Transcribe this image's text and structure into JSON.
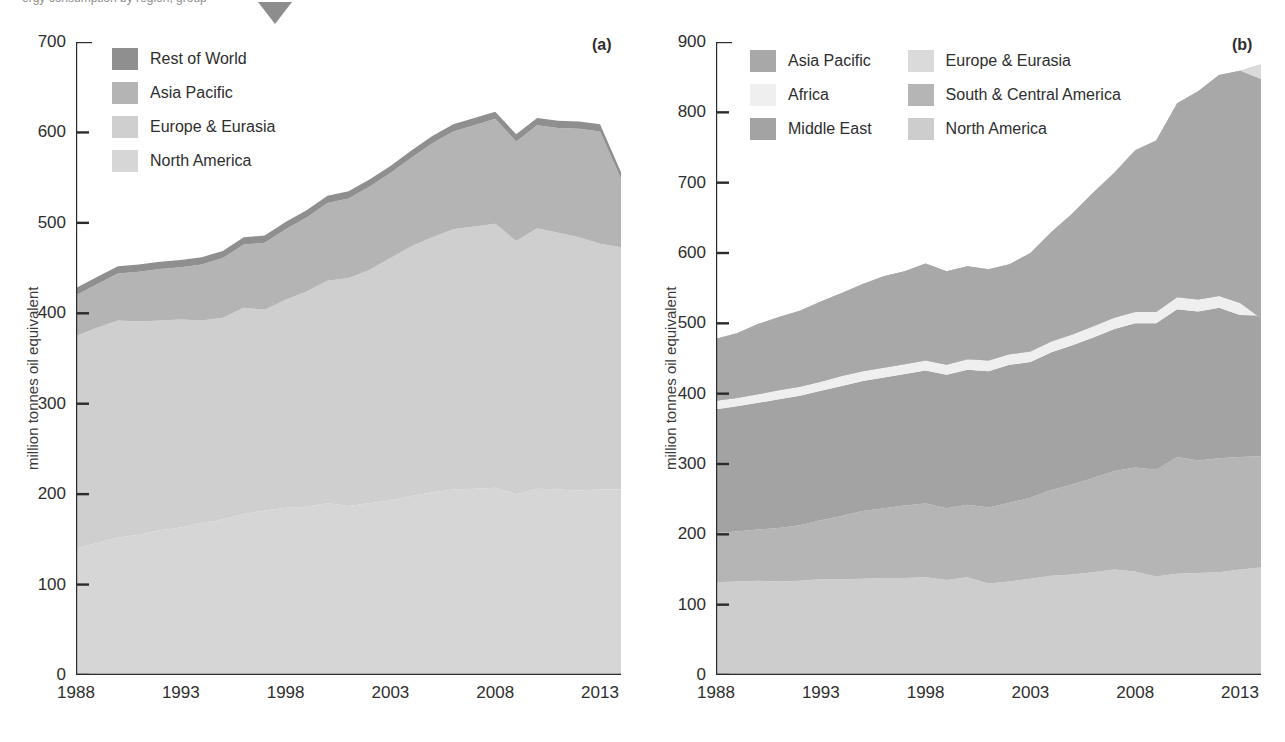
{
  "page": {
    "clipped_header_text": "ergy consumption by region, group",
    "marker_icon": "triangle-down-marker"
  },
  "panel_a": {
    "tag": "(a)",
    "ylabel": "million tonnes oil equivalent",
    "yticks": [
      0,
      100,
      200,
      300,
      400,
      500,
      600,
      700
    ],
    "xticks": [
      "1988",
      "1993",
      "1998",
      "2003",
      "2008",
      "2013"
    ],
    "legend": [
      {
        "label": "Rest of World",
        "color": "#8f8f8f"
      },
      {
        "label": "Asia Pacific",
        "color": "#b4b4b4"
      },
      {
        "label": "Europe & Eurasia",
        "color": "#cfcfcf"
      },
      {
        "label": "North America",
        "color": "#d6d6d6"
      }
    ]
  },
  "panel_b": {
    "tag": "(b)",
    "ylabel": "million tonnes oil equivalent",
    "yticks": [
      0,
      100,
      200,
      300,
      400,
      500,
      600,
      700,
      800,
      900
    ],
    "xticks": [
      "1988",
      "1993",
      "1998",
      "2003",
      "2008",
      "2013"
    ],
    "legend": [
      {
        "label": "Asia Pacific",
        "color": "#a8a8a8"
      },
      {
        "label": "Europe & Eurasia",
        "color": "#dadada"
      },
      {
        "label": "Africa",
        "color": "#efefef"
      },
      {
        "label": "South & Central America",
        "color": "#b5b5b5"
      },
      {
        "label": "Middle East",
        "color": "#a3a3a3"
      },
      {
        "label": "North America",
        "color": "#cdcdcd"
      }
    ]
  },
  "chart_data": [
    {
      "id": "chart-a",
      "type": "area",
      "title": "(a)",
      "xlabel": "",
      "ylabel": "million tonnes oil equivalent",
      "ylim": [
        0,
        700
      ],
      "xlim": [
        1988,
        2014
      ],
      "grid": false,
      "legend_position": "top-left",
      "stacked": true,
      "x": [
        1988,
        1989,
        1990,
        1991,
        1992,
        1993,
        1994,
        1995,
        1996,
        1997,
        1998,
        1999,
        2000,
        2001,
        2002,
        2003,
        2004,
        2005,
        2006,
        2007,
        2008,
        2009,
        2010,
        2011,
        2012,
        2013,
        2014
      ],
      "series": [
        {
          "name": "North America",
          "color": "#d6d6d6",
          "values": [
            140,
            146,
            152,
            155,
            160,
            163,
            168,
            172,
            178,
            182,
            185,
            186,
            190,
            187,
            190,
            193,
            198,
            202,
            205,
            206,
            207,
            200,
            206,
            205,
            204,
            205,
            205
          ]
        },
        {
          "name": "Europe & Eurasia",
          "color": "#cfcfcf",
          "values": [
            235,
            238,
            240,
            236,
            232,
            230,
            224,
            223,
            228,
            222,
            230,
            238,
            246,
            252,
            258,
            268,
            276,
            282,
            288,
            290,
            292,
            280,
            288,
            284,
            280,
            272,
            268
          ]
        },
        {
          "name": "Asia Pacific",
          "color": "#b4b4b4",
          "values": [
            45,
            48,
            52,
            55,
            57,
            58,
            62,
            66,
            70,
            74,
            78,
            82,
            86,
            88,
            92,
            94,
            98,
            104,
            108,
            112,
            116,
            110,
            114,
            116,
            120,
            124,
            76
          ]
        },
        {
          "name": "Rest of World",
          "color": "#8f8f8f",
          "values": [
            8,
            8,
            8,
            8,
            8,
            8,
            8,
            8,
            8,
            8,
            8,
            8,
            8,
            8,
            8,
            8,
            8,
            8,
            8,
            8,
            8,
            8,
            8,
            8,
            8,
            8,
            7
          ]
        }
      ],
      "totals": [
        428,
        440,
        452,
        454,
        457,
        459,
        462,
        469,
        484,
        486,
        501,
        514,
        530,
        535,
        548,
        563,
        580,
        596,
        609,
        616,
        623,
        598,
        616,
        613,
        612,
        609,
        556
      ],
      "annotations": [
        "Totals rise from about 428 in 1988 to a peak near 625 around 2007, then fall to about 556 in 2014"
      ]
    },
    {
      "id": "chart-b",
      "type": "area",
      "title": "(b)",
      "xlabel": "",
      "ylabel": "million tonnes oil equivalent",
      "ylim": [
        0,
        900
      ],
      "xlim": [
        1988,
        2014
      ],
      "grid": false,
      "legend_position": "top-left",
      "stacked": true,
      "x": [
        1988,
        1989,
        1990,
        1991,
        1992,
        1993,
        1994,
        1995,
        1996,
        1997,
        1998,
        1999,
        2000,
        2001,
        2002,
        2003,
        2004,
        2005,
        2006,
        2007,
        2008,
        2009,
        2010,
        2011,
        2012,
        2013,
        2014
      ],
      "series": [
        {
          "name": "North America",
          "color": "#cdcdcd",
          "values": [
            132,
            133,
            134,
            133,
            134,
            136,
            136,
            137,
            138,
            138,
            139,
            135,
            139,
            130,
            133,
            137,
            141,
            143,
            146,
            150,
            147,
            140,
            144,
            145,
            146,
            150,
            153
          ]
        },
        {
          "name": "South & Central America",
          "color": "#b5b5b5",
          "values": [
            70,
            71,
            73,
            76,
            79,
            84,
            90,
            96,
            99,
            103,
            105,
            102,
            103,
            108,
            112,
            115,
            122,
            128,
            134,
            140,
            148,
            152,
            166,
            160,
            162,
            160,
            158
          ]
        },
        {
          "name": "Middle East",
          "color": "#a3a3a3",
          "values": [
            176,
            178,
            180,
            183,
            184,
            184,
            185,
            185,
            186,
            187,
            189,
            190,
            192,
            194,
            196,
            193,
            196,
            198,
            200,
            202,
            205,
            208,
            210,
            212,
            214,
            202,
            200
          ]
        },
        {
          "name": "Africa",
          "color": "#efefef",
          "values": [
            12,
            12,
            12,
            13,
            13,
            13,
            14,
            14,
            14,
            14,
            14,
            14,
            15,
            15,
            15,
            15,
            15,
            15,
            16,
            16,
            16,
            16,
            17,
            17,
            17,
            17,
            17
          ]
        },
        {
          "name": "Europe & Eurasia",
          "color": "#dadada"
        },
        {
          "name": "Asia Pacific",
          "color": "#a8a8a8",
          "values": [
            88,
            92,
            100,
            104,
            108,
            114,
            118,
            124,
            130,
            132,
            138,
            133,
            132,
            130,
            128,
            140,
            156,
            172,
            190,
            206,
            230,
            244,
            276,
            296,
            314,
            330,
            340
          ]
        }
      ],
      "totals": [
        478,
        486,
        499,
        509,
        518,
        531,
        543,
        556,
        567,
        574,
        585,
        574,
        581,
        577,
        584,
        600,
        630,
        656,
        686,
        714,
        746,
        760,
        813,
        830,
        853,
        859,
        847
      ],
      "annotations": [
        "Thin light Africa band separates Middle East from Europe & Eurasia",
        "Totals climb steadily from about 478 in 1988 to roughly 850 by 2014"
      ]
    }
  ]
}
